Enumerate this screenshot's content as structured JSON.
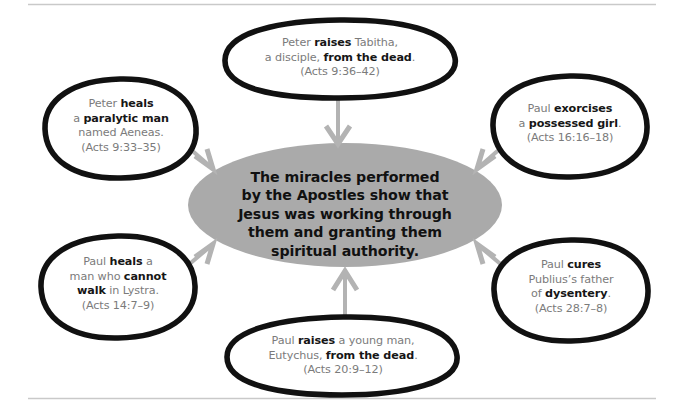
{
  "diagram": {
    "title": "Miracles performed by the Apostles",
    "colors": {
      "oval_stroke": "#111111",
      "center_fill": "#aaaaaa",
      "arrow": "#b3b3b3",
      "body_text": "#7b7b7b",
      "emphasis_text": "#161616",
      "border": "#c9c9c9",
      "background": "#ffffff"
    },
    "center": {
      "id": "center-ellipse",
      "lines": [
        "The miracles performed",
        "by the Apostles show that",
        "Jesus was working through",
        "them and granting them",
        "spiritual authority."
      ]
    },
    "nodes": [
      {
        "id": "node-top",
        "position": "top",
        "lines": [
          [
            {
              "t": "Peter ",
              "b": false
            },
            {
              "t": "raises",
              "b": true
            },
            {
              "t": " Tabitha,",
              "b": false
            }
          ],
          [
            {
              "t": "a disciple, ",
              "b": false
            },
            {
              "t": "from the dead",
              "b": true
            },
            {
              "t": ".",
              "b": false
            }
          ],
          [
            {
              "t": "(Acts 9:36–42)",
              "b": false
            }
          ]
        ],
        "reference": "Acts 9:36–42"
      },
      {
        "id": "node-upper-left",
        "position": "upper-left",
        "lines": [
          [
            {
              "t": "Peter ",
              "b": false
            },
            {
              "t": "heals",
              "b": true
            }
          ],
          [
            {
              "t": "a ",
              "b": false
            },
            {
              "t": "paralytic man",
              "b": true
            }
          ],
          [
            {
              "t": "named Aeneas.",
              "b": false
            }
          ],
          [
            {
              "t": "(Acts 9:33–35)",
              "b": false
            }
          ]
        ],
        "reference": "Acts 9:33–35"
      },
      {
        "id": "node-upper-right",
        "position": "upper-right",
        "lines": [
          [
            {
              "t": "Paul ",
              "b": false
            },
            {
              "t": "exorcises",
              "b": true
            }
          ],
          [
            {
              "t": "a ",
              "b": false
            },
            {
              "t": "possessed girl",
              "b": true
            },
            {
              "t": ".",
              "b": false
            }
          ],
          [
            {
              "t": "(Acts 16:16–18)",
              "b": false
            }
          ]
        ],
        "reference": "Acts 16:16–18"
      },
      {
        "id": "node-lower-left",
        "position": "lower-left",
        "lines": [
          [
            {
              "t": "Paul ",
              "b": false
            },
            {
              "t": "heals",
              "b": true
            },
            {
              "t": " a",
              "b": false
            }
          ],
          [
            {
              "t": "man who ",
              "b": false
            },
            {
              "t": "cannot",
              "b": true
            }
          ],
          [
            {
              "t": "walk",
              "b": true
            },
            {
              "t": " in Lystra.",
              "b": false
            }
          ],
          [
            {
              "t": "(Acts 14:7–9)",
              "b": false
            }
          ]
        ],
        "reference": "Acts 14:7–9"
      },
      {
        "id": "node-lower-right",
        "position": "lower-right",
        "lines": [
          [
            {
              "t": "Paul ",
              "b": false
            },
            {
              "t": "cures",
              "b": true
            }
          ],
          [
            {
              "t": "Publius’s father",
              "b": false
            }
          ],
          [
            {
              "t": "of ",
              "b": false
            },
            {
              "t": "dysentery",
              "b": true
            },
            {
              "t": ".",
              "b": false
            }
          ],
          [
            {
              "t": "(Acts 28:7–8)",
              "b": false
            }
          ]
        ],
        "reference": "Acts 28:7–8"
      },
      {
        "id": "node-bottom",
        "position": "bottom",
        "lines": [
          [
            {
              "t": "Paul ",
              "b": false
            },
            {
              "t": "raises",
              "b": true
            },
            {
              "t": " a young man,",
              "b": false
            }
          ],
          [
            {
              "t": "Eutychus, ",
              "b": false
            },
            {
              "t": "from the dead",
              "b": true
            },
            {
              "t": ".",
              "b": false
            }
          ],
          [
            {
              "t": "(Acts 20:9–12)",
              "b": false
            }
          ]
        ],
        "reference": "Acts 20:9–12"
      }
    ],
    "arrows": [
      {
        "id": "arrow-top",
        "from": "node-top",
        "to": "center-ellipse",
        "direction": "down"
      },
      {
        "id": "arrow-upper-left",
        "from": "node-upper-left",
        "to": "center-ellipse",
        "direction": "down-right"
      },
      {
        "id": "arrow-upper-right",
        "from": "node-upper-right",
        "to": "center-ellipse",
        "direction": "down-left"
      },
      {
        "id": "arrow-lower-left",
        "from": "node-lower-left",
        "to": "center-ellipse",
        "direction": "up-right"
      },
      {
        "id": "arrow-lower-right",
        "from": "node-lower-right",
        "to": "center-ellipse",
        "direction": "up-left"
      },
      {
        "id": "arrow-bottom",
        "from": "node-bottom",
        "to": "center-ellipse",
        "direction": "up"
      }
    ]
  }
}
